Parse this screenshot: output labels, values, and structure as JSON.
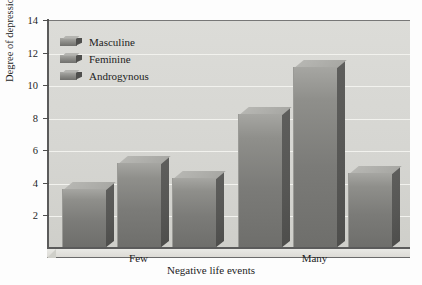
{
  "chart_data": {
    "type": "bar",
    "title": "",
    "subtitle": "",
    "xlabel": "Negative life events",
    "ylabel": "Degree of depression",
    "categories": [
      "Few",
      "Many"
    ],
    "series": [
      {
        "name": "Masculine",
        "values": [
          3.6,
          8.2
        ]
      },
      {
        "name": "Feminine",
        "values": [
          5.2,
          11.1
        ]
      },
      {
        "name": "Androgynous",
        "values": [
          4.3,
          4.6
        ]
      }
    ],
    "ylim": [
      0,
      14
    ],
    "yticks": [
      2,
      4,
      6,
      8,
      10,
      12,
      14
    ],
    "ytick_labels": [
      "2",
      "4",
      "6",
      "8",
      "10",
      "12",
      "14"
    ],
    "grid": true,
    "grid_orientation": "horizontal",
    "legend_position": "top-left",
    "style": "3d-bar",
    "colors": {
      "bar_front_light": "#a6a6a2",
      "bar_front_dark": "#6e6e6b",
      "bar_side": "#56564f",
      "bar_top": "#b4b4b0",
      "plot_background": "#d8d8d4",
      "gridline": "#f2f2ee",
      "axis": "#5b5b5b",
      "text": "#1d1d1d",
      "figure_background": "#ffffff"
    }
  },
  "legend": {
    "items": [
      {
        "label": "Masculine"
      },
      {
        "label": "Feminine"
      },
      {
        "label": "Androgynous"
      }
    ]
  },
  "axes": {
    "y_title": "Degree of depression",
    "x_title": "Negative life events"
  }
}
